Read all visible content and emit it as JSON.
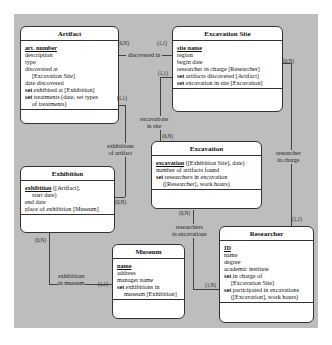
{
  "entities": {
    "artifact": {
      "title": "Artifact",
      "attrs": [
        {
          "key": "art. number"
        },
        {
          "text": "description"
        },
        {
          "text": "type"
        },
        {
          "text": "discovered at"
        },
        {
          "text": "[Excavation Site]",
          "indent": true
        },
        {
          "text": "date discovered"
        },
        {
          "kw": "set",
          "text": " exhibited at [Exhibition]"
        },
        {
          "kw": "set",
          "text": " treatments (date, set types"
        },
        {
          "text": "of treatments)",
          "indent": true
        }
      ]
    },
    "excavation_site": {
      "title": "Excavation Site",
      "attrs": [
        {
          "key": "site name"
        },
        {
          "text": "region"
        },
        {
          "text": "begin date"
        },
        {
          "text": "researcher in charge [Researcher]"
        },
        {
          "kw": "set",
          "text": " artifacts discovered [Artifact]"
        },
        {
          "kw": "set",
          "text": " excavation in site [Excavation]"
        }
      ]
    },
    "excavation": {
      "title": "Excavation",
      "attrs": [
        {
          "key": "excavation",
          "text": " ([Exhibition Site], date)"
        },
        {
          "text": "number of artifacts found"
        },
        {
          "kw": "set",
          "text": " researchers in excavation"
        },
        {
          "text": "([Researcher], work hours)",
          "indent": true
        }
      ]
    },
    "exhibition": {
      "title": "Exhibition",
      "attrs": [
        {
          "key": "exhibition",
          "text": " ([Artifact],"
        },
        {
          "text": "start date)",
          "indent": true
        },
        {
          "text": "end date"
        },
        {
          "text": "place of exhibition [Museum]"
        }
      ]
    },
    "museum": {
      "title": "Museum",
      "attrs": [
        {
          "key": "name"
        },
        {
          "text": "address"
        },
        {
          "text": "manager name"
        },
        {
          "kw": "set",
          "text": " exhibitions in"
        },
        {
          "text": "museum [Exhibition]",
          "indent": true
        }
      ]
    },
    "researcher": {
      "title": "Researcher",
      "attrs": [
        {
          "key": "ID"
        },
        {
          "text": "name"
        },
        {
          "text": "degree"
        },
        {
          "text": "academic institute"
        },
        {
          "kw": "set",
          "text": " in charge of"
        },
        {
          "text": "[Excavation Site]",
          "indent": true
        },
        {
          "kw": "set",
          "text": " participated in excavations"
        },
        {
          "text": "([Excavation], work hours)",
          "indent": true
        }
      ]
    }
  },
  "relationships": {
    "discovered_in": {
      "label": "discovered in",
      "card_a": "(0,N)",
      "card_b": "(1,1)"
    },
    "excavations_in_site": {
      "label1": "excavations",
      "label2": "in site",
      "card_a": "(1,1)",
      "card_b": "(0,N)"
    },
    "exhibitions_of_artifact": {
      "label1": "exhibitions",
      "label2": "of artifact",
      "card_a": "(1,1)",
      "card_b": "(0,N)"
    },
    "researcher_in_charge": {
      "label1": "researcher",
      "label2": "in charge",
      "card_a": "(0,N)",
      "card_b": "(1,1)"
    },
    "researchers_in_excavations": {
      "label1": "researchers",
      "label2": "in excavations",
      "card_a": "(0,N)",
      "card_b": "(1,N)"
    },
    "exhibitions_in_museum": {
      "label1": "exhibitions",
      "label2": "in museum",
      "card_a": "(0,N)",
      "card_b": "(1,1)"
    }
  }
}
